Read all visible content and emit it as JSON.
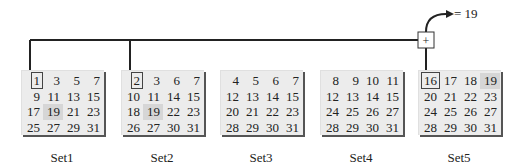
{
  "diagram": {
    "title": "",
    "result_label": "= 19",
    "combiner_symbol": "+",
    "sets": [
      {
        "label": "Set1",
        "rows": [
          [
            "1",
            "3",
            "5",
            "7"
          ],
          [
            "9",
            "11",
            "13",
            "15"
          ],
          [
            "17",
            "19",
            "21",
            "23"
          ],
          [
            "25",
            "27",
            "29",
            "31"
          ]
        ],
        "boxed": [
          0,
          0
        ],
        "highlight": [
          2,
          1
        ],
        "connected": true
      },
      {
        "label": "Set2",
        "rows": [
          [
            "2",
            "3",
            "6",
            "7"
          ],
          [
            "10",
            "11",
            "14",
            "15"
          ],
          [
            "18",
            "19",
            "22",
            "23"
          ],
          [
            "26",
            "27",
            "30",
            "31"
          ]
        ],
        "boxed": [
          0,
          0
        ],
        "highlight": [
          2,
          1
        ],
        "connected": true
      },
      {
        "label": "Set3",
        "rows": [
          [
            "4",
            "5",
            "6",
            "7"
          ],
          [
            "12",
            "13",
            "14",
            "15"
          ],
          [
            "20",
            "21",
            "22",
            "23"
          ],
          [
            "28",
            "29",
            "30",
            "31"
          ]
        ],
        "boxed": null,
        "highlight": null,
        "connected": false
      },
      {
        "label": "Set4",
        "rows": [
          [
            "8",
            "9",
            "10",
            "11"
          ],
          [
            "12",
            "13",
            "14",
            "15"
          ],
          [
            "24",
            "25",
            "26",
            "27"
          ],
          [
            "28",
            "29",
            "30",
            "31"
          ]
        ],
        "boxed": null,
        "highlight": null,
        "connected": false
      },
      {
        "label": "Set5",
        "rows": [
          [
            "16",
            "17",
            "18",
            "19"
          ],
          [
            "20",
            "21",
            "22",
            "23"
          ],
          [
            "24",
            "25",
            "26",
            "27"
          ],
          [
            "28",
            "29",
            "30",
            "31"
          ]
        ],
        "boxed": [
          0,
          0
        ],
        "highlight": [
          0,
          3
        ],
        "connected": true
      }
    ],
    "colors": {
      "card_bg": "#ececec",
      "highlight_bg": "#d6d6d6",
      "line": "#222222",
      "shadow": "#555555"
    }
  }
}
